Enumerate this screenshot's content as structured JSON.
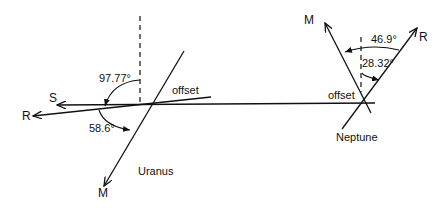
{
  "diagram": {
    "type": "planet-axis-geometry",
    "uranus": {
      "name": "Uranus",
      "vectors": {
        "spin": "S",
        "rotation": "R",
        "magnetic": "M"
      },
      "angles": {
        "rotation_to_vertical": "97.77°",
        "magnetic_to_rotation": "58.6°"
      },
      "offset_label": "offset"
    },
    "neptune": {
      "name": "Neptune",
      "vectors": {
        "rotation": "R",
        "magnetic": "M"
      },
      "angles": {
        "magnetic_to_rotation": "46.9°",
        "rotation_to_vertical": "28.32°"
      },
      "offset_label": "offset"
    }
  }
}
